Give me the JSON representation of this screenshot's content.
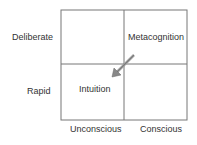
{
  "diagram": {
    "row_labels": [
      "Deliberate",
      "Rapid"
    ],
    "col_labels": [
      "Unconscious",
      "Conscious"
    ],
    "cells": {
      "top_right": "Metacognition",
      "bottom_left": "Intuition"
    },
    "arrow": {
      "from": "Metacognition",
      "to": "Intuition",
      "color": "#888888"
    },
    "grid_color": "#777777"
  }
}
